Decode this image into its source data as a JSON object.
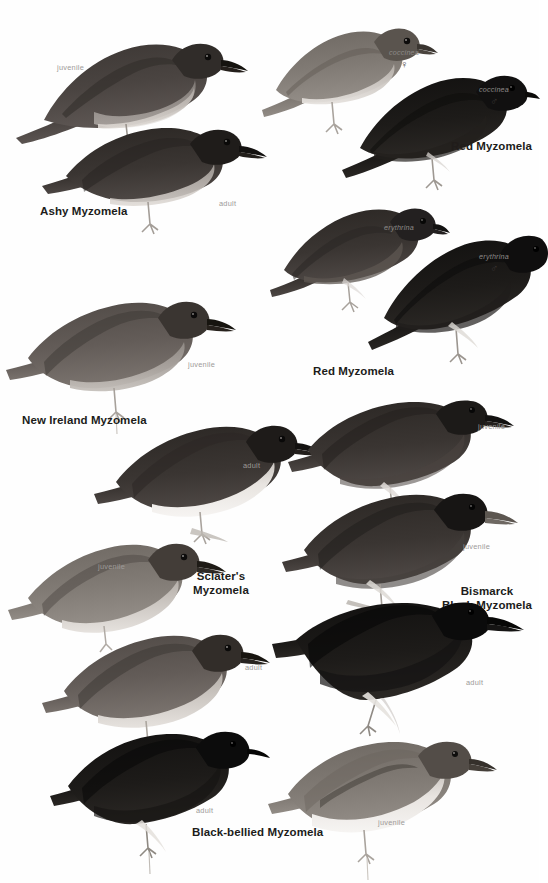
{
  "plate": {
    "kind": "field-guide-illustration-plate",
    "background_color": "#ffffff",
    "species_label_color": "#201c1a",
    "age_label_color": "#9d9a98",
    "subspecies_label_color": "#8d8a88"
  },
  "species": [
    {
      "id": "ashy-myzomela",
      "name": "Ashy Myzomela",
      "figures": [
        {
          "age": "juvenile"
        },
        {
          "age": "adult"
        }
      ]
    },
    {
      "id": "red-myzomela-coccinea",
      "name": "Red Myzomela",
      "figures": [
        {
          "subspecies": "coccinea",
          "sex": "♀"
        },
        {
          "subspecies": "coccinea",
          "sex": "♂"
        }
      ]
    },
    {
      "id": "red-myzomela-erythrina",
      "name": "Red Myzomela",
      "figures": [
        {
          "subspecies": "erythrina",
          "sex": "♀"
        },
        {
          "subspecies": "erythrina",
          "sex": "♂"
        }
      ]
    },
    {
      "id": "new-ireland-myzomela",
      "name": "New Ireland Myzomela",
      "figures": [
        {
          "age": "juvenile"
        },
        {
          "age": "adult"
        }
      ]
    },
    {
      "id": "sclaters-myzomela",
      "name_line1": "Sclater's",
      "name_line2": "Myzomela",
      "figures": [
        {
          "age": "juvenile"
        },
        {
          "age": "adult"
        }
      ]
    },
    {
      "id": "bismarck-black-myzomela",
      "name_line1": "Bismarck",
      "name_line2": "Black Myzomela",
      "figures": [
        {
          "age": "juvenile"
        },
        {
          "age": "juvenile"
        },
        {
          "age": "adult"
        }
      ]
    },
    {
      "id": "black-bellied-myzomela",
      "name": "Black-bellied Myzomela",
      "figures": [
        {
          "age": "adult"
        },
        {
          "age": "juvenile"
        }
      ]
    }
  ],
  "labels": {
    "ashy_name": "Ashy Myzomela",
    "ashy_juvenile": "juvenile",
    "ashy_adult": "adult",
    "red1_name": "Red Myzomela",
    "red1_f_ssp": "coccinea",
    "red1_f_sex": "♀",
    "red1_m_ssp": "coccinea",
    "red1_m_sex": "♂",
    "red2_name": "Red Myzomela",
    "red2_f_ssp": "erythrina",
    "red2_f_sex": "♀",
    "red2_m_ssp": "erythrina",
    "red2_m_sex": "♂",
    "newireland_name": "New Ireland Myzomela",
    "newireland_juvenile": "juvenile",
    "newireland_adult": "adult",
    "sclater_name_1": "Sclater's",
    "sclater_name_2": "Myzomela",
    "sclater_juvenile": "juvenile",
    "sclater_adult": "adult",
    "bismarck_name_1": "Bismarck",
    "bismarck_name_2": "Black Myzomela",
    "bismarck_juvenile_1": "juvenile",
    "bismarck_juvenile_2": "juvenile",
    "bismarck_adult": "adult",
    "blackbellied_name": "Black-bellied Myzomela",
    "blackbellied_adult": "adult",
    "blackbellied_juvenile": "juvenile"
  }
}
